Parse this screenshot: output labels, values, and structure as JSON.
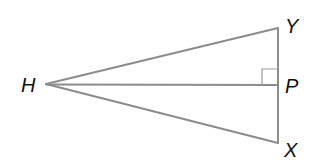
{
  "diagram": {
    "type": "geometry-triangle",
    "points": {
      "H": {
        "label": "H",
        "x": 46,
        "y": 84
      },
      "Y": {
        "label": "Y",
        "x": 278,
        "y": 28
      },
      "P": {
        "label": "P",
        "x": 278,
        "y": 85
      },
      "X": {
        "label": "X",
        "x": 278,
        "y": 143
      }
    },
    "segments": [
      "HY",
      "HX",
      "HP",
      "YP",
      "PX"
    ],
    "right_angle_at": "P",
    "colors": {
      "line": "#8c8c8c",
      "label": "#111111",
      "background": "#ffffff"
    }
  }
}
